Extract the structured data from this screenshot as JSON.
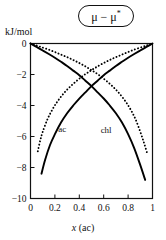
{
  "figure": {
    "ylabel": "kJ/mol",
    "xlabel_italic": "x",
    "xlabel_rest": " (ac)",
    "title_text": "μ − μ",
    "title_sup": "*"
  },
  "chart_data": {
    "type": "line",
    "title": "μ − μ*",
    "xlabel": "x (ac)",
    "ylabel": "kJ/mol",
    "xlim": [
      0,
      1
    ],
    "ylim": [
      -10,
      0
    ],
    "grid": false,
    "legend": "inline-curve-labels",
    "xticks": [
      0,
      0.2,
      0.4,
      0.6,
      0.8,
      1
    ],
    "xticklabels": [
      "0",
      "0.2",
      "0.4",
      "0.6",
      "0.8",
      "1"
    ],
    "yticks": [
      0,
      -2,
      -4,
      -6,
      -8,
      -10
    ],
    "yticklabels": [
      "0",
      "−2",
      "−4",
      "−6",
      "−8",
      "−10"
    ],
    "annotations": [
      {
        "text": "ac",
        "x": 0.26,
        "y": -5.7
      },
      {
        "text": "chl",
        "x": 0.62,
        "y": -5.8
      }
    ],
    "series": [
      {
        "name": "ac",
        "style": "solid",
        "color": "#000000",
        "x": [
          0.09,
          0.12,
          0.16,
          0.2,
          0.25,
          0.3,
          0.35,
          0.4,
          0.45,
          0.5,
          0.55,
          0.6,
          0.65,
          0.7,
          0.75,
          0.8,
          0.85,
          0.9,
          0.95,
          1.0
        ],
        "values": [
          -8.4,
          -7.5,
          -6.55,
          -5.85,
          -5.1,
          -4.5,
          -4.0,
          -3.55,
          -3.15,
          -2.75,
          -2.4,
          -2.05,
          -1.75,
          -1.45,
          -1.18,
          -0.92,
          -0.68,
          -0.45,
          -0.22,
          0.0
        ]
      },
      {
        "name": "chl",
        "style": "solid",
        "color": "#000000",
        "x": [
          0.0,
          0.05,
          0.1,
          0.15,
          0.2,
          0.25,
          0.3,
          0.35,
          0.4,
          0.45,
          0.5,
          0.55,
          0.6,
          0.65,
          0.7,
          0.75,
          0.8,
          0.85,
          0.9,
          0.94
        ],
        "values": [
          0.0,
          -0.22,
          -0.45,
          -0.68,
          -0.92,
          -1.18,
          -1.45,
          -1.75,
          -2.05,
          -2.4,
          -2.75,
          -3.15,
          -3.55,
          -4.0,
          -4.5,
          -5.1,
          -5.85,
          -6.75,
          -7.85,
          -8.8
        ]
      },
      {
        "name": "ac-ideal",
        "style": "dotted",
        "color": "#000000",
        "x": [
          0.06,
          0.08,
          0.1,
          0.14,
          0.18,
          0.22,
          0.27,
          0.32,
          0.38,
          0.44,
          0.5,
          0.56,
          0.62,
          0.68,
          0.74,
          0.8,
          0.86,
          0.92,
          0.96,
          1.0
        ],
        "values": [
          -6.95,
          -6.25,
          -5.7,
          -4.87,
          -4.25,
          -3.75,
          -3.24,
          -2.82,
          -2.4,
          -2.03,
          -1.72,
          -1.43,
          -1.18,
          -0.95,
          -0.75,
          -0.55,
          -0.37,
          -0.21,
          -0.1,
          0.0
        ]
      },
      {
        "name": "chl-ideal",
        "style": "dotted",
        "color": "#000000",
        "x": [
          0.0,
          0.04,
          0.08,
          0.14,
          0.2,
          0.26,
          0.32,
          0.38,
          0.44,
          0.5,
          0.56,
          0.62,
          0.68,
          0.73,
          0.78,
          0.82,
          0.86,
          0.9,
          0.93,
          0.955
        ],
        "values": [
          0.0,
          -0.1,
          -0.21,
          -0.37,
          -0.55,
          -0.75,
          -0.95,
          -1.18,
          -1.43,
          -1.72,
          -2.03,
          -2.4,
          -2.82,
          -3.24,
          -3.75,
          -4.25,
          -4.87,
          -5.7,
          -6.4,
          -7.05
        ]
      }
    ]
  }
}
